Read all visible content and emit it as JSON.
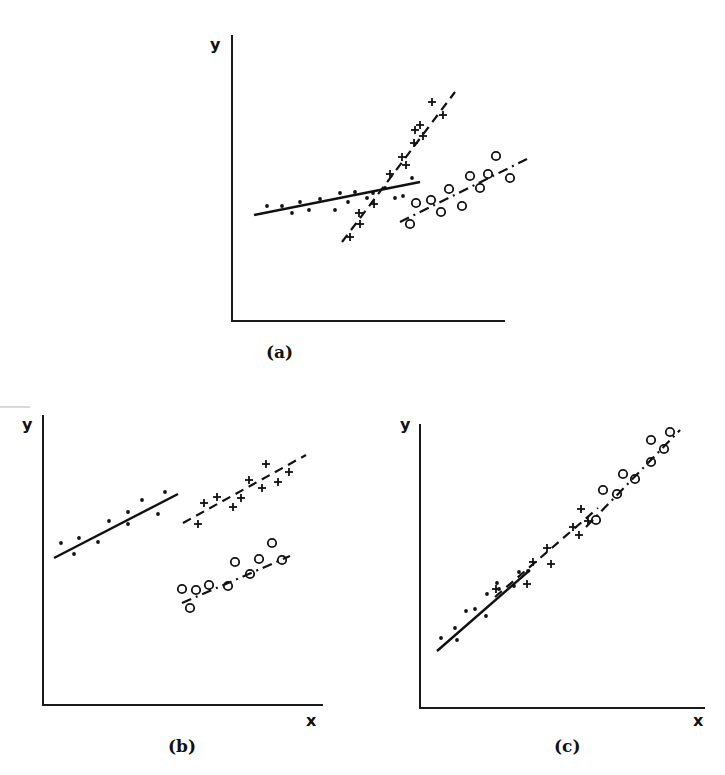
{
  "figure": {
    "panels": [
      "(a)",
      "(b)",
      "(c)"
    ]
  },
  "chart_data": [
    {
      "type": "scatter",
      "title": "(a)",
      "xlabel": "",
      "ylabel": "y",
      "grid": false,
      "legend": null,
      "frame": {
        "x0": 232,
        "y0": 321,
        "x1": 505,
        "y1": 35
      },
      "label_pos": {
        "ylabel": [
          210,
          50
        ],
        "panel": [
          266,
          358
        ]
      },
      "series": [
        {
          "name": "group-dots",
          "marker": "dot",
          "line_style": "solid",
          "fit_line": [
            [
              254,
              215
            ],
            [
              420,
              182
            ]
          ],
          "points": [
            [
              267,
              206
            ],
            [
              282,
              206
            ],
            [
              292,
              213
            ],
            [
              300,
              202
            ],
            [
              309,
              210
            ],
            [
              320,
              199
            ],
            [
              335,
              210
            ],
            [
              340,
              193
            ],
            [
              348,
              202
            ],
            [
              355,
              192
            ],
            [
              367,
              198
            ],
            [
              373,
              193
            ],
            [
              385,
              188
            ],
            [
              395,
              198
            ],
            [
              403,
              196
            ],
            [
              412,
              178
            ]
          ]
        },
        {
          "name": "group-plus",
          "marker": "plus",
          "line_style": "dashed",
          "fit_line": [
            [
              342,
              242
            ],
            [
              455,
              92
            ]
          ],
          "points": [
            [
              350,
              237
            ],
            [
              360,
              224
            ],
            [
              359,
              213
            ],
            [
              374,
              204
            ],
            [
              390,
              174
            ],
            [
              402,
              157
            ],
            [
              406,
              165
            ],
            [
              414,
              143
            ],
            [
              415,
              130
            ],
            [
              420,
              125
            ],
            [
              423,
              136
            ],
            [
              432,
              102
            ],
            [
              443,
              115
            ]
          ]
        },
        {
          "name": "group-circles",
          "marker": "circle",
          "line_style": "dashdot",
          "fit_line": [
            [
              400,
              222
            ],
            [
              527,
              159
            ]
          ],
          "points": [
            [
              410,
              224
            ],
            [
              416,
              203
            ],
            [
              431,
              200
            ],
            [
              441,
              212
            ],
            [
              449,
              189
            ],
            [
              462,
              206
            ],
            [
              470,
              176
            ],
            [
              480,
              188
            ],
            [
              488,
              174
            ],
            [
              496,
              156
            ],
            [
              510,
              178
            ]
          ]
        }
      ]
    },
    {
      "type": "scatter",
      "title": "(b)",
      "xlabel": "x",
      "ylabel": "y",
      "grid": false,
      "legend": null,
      "frame": {
        "x0": 43,
        "y0": 705,
        "x1": 323,
        "y1": 415
      },
      "label_pos": {
        "ylabel": [
          22,
          430
        ],
        "xlabel": [
          306,
          726
        ],
        "panel": [
          168,
          752
        ]
      },
      "series": [
        {
          "name": "group-dots",
          "marker": "dot",
          "line_style": "solid",
          "fit_line": [
            [
              54,
              558
            ],
            [
              178,
              494
            ]
          ],
          "points": [
            [
              61,
              543
            ],
            [
              74,
              554
            ],
            [
              79,
              538
            ],
            [
              98,
              542
            ],
            [
              109,
              521
            ],
            [
              128,
              524
            ],
            [
              128,
              512
            ],
            [
              142,
              500
            ],
            [
              158,
              514
            ],
            [
              165,
              492
            ]
          ]
        },
        {
          "name": "group-plus",
          "marker": "plus",
          "line_style": "dashed",
          "fit_line": [
            [
              183,
              523
            ],
            [
              306,
              455
            ]
          ],
          "points": [
            [
              198,
              524
            ],
            [
              204,
              503
            ],
            [
              217,
              497
            ],
            [
              233,
              507
            ],
            [
              241,
              498
            ],
            [
              249,
              480
            ],
            [
              262,
              488
            ],
            [
              266,
              464
            ],
            [
              278,
              482
            ],
            [
              289,
              472
            ]
          ]
        },
        {
          "name": "group-circles",
          "marker": "circle",
          "line_style": "dashdot",
          "fit_line": [
            [
              182,
              603
            ],
            [
              290,
              556
            ]
          ],
          "points": [
            [
              182,
              589
            ],
            [
              190,
              608
            ],
            [
              196,
              590
            ],
            [
              209,
              585
            ],
            [
              228,
              586
            ],
            [
              235,
              562
            ],
            [
              250,
              574
            ],
            [
              259,
              559
            ],
            [
              272,
              543
            ],
            [
              282,
              560
            ]
          ]
        }
      ]
    },
    {
      "type": "scatter",
      "title": "(c)",
      "xlabel": "x",
      "ylabel": "y",
      "grid": false,
      "legend": null,
      "frame": {
        "x0": 420,
        "y0": 708,
        "x1": 705,
        "y1": 424
      },
      "label_pos": {
        "ylabel": [
          400,
          430
        ],
        "xlabel": [
          693,
          726
        ],
        "panel": [
          554,
          752
        ]
      },
      "series": [
        {
          "name": "group-dots",
          "marker": "dot",
          "line_style": "solid",
          "fit_line": [
            [
              437,
              651
            ],
            [
              530,
              570
            ]
          ],
          "points": [
            [
              441,
              638
            ],
            [
              455,
              628
            ],
            [
              457,
              640
            ],
            [
              466,
              611
            ],
            [
              475,
              609
            ],
            [
              486,
              616
            ],
            [
              487,
              594
            ],
            [
              497,
              583
            ],
            [
              499,
              589
            ],
            [
              514,
              586
            ],
            [
              519,
              572
            ],
            [
              528,
              571
            ]
          ]
        },
        {
          "name": "group-plus",
          "marker": "plus",
          "line_style": "dashed",
          "fit_line": [
            [
              495,
              597
            ],
            [
              598,
              508
            ]
          ],
          "points": [
            [
              496,
              589
            ],
            [
              527,
              584
            ],
            [
              533,
              562
            ],
            [
              551,
              564
            ],
            [
              547,
              548
            ],
            [
              573,
              527
            ],
            [
              579,
              535
            ],
            [
              588,
              521
            ],
            [
              581,
              509
            ]
          ]
        },
        {
          "name": "group-circles",
          "marker": "circle",
          "line_style": "dashdot",
          "fit_line": [
            [
              586,
              527
            ],
            [
              680,
              430
            ]
          ],
          "points": [
            [
              596,
              520
            ],
            [
              603,
              490
            ],
            [
              617,
              494
            ],
            [
              623,
              474
            ],
            [
              635,
              479
            ],
            [
              651,
              440
            ],
            [
              651,
              462
            ],
            [
              664,
              449
            ],
            [
              670,
              432
            ]
          ]
        }
      ]
    }
  ]
}
